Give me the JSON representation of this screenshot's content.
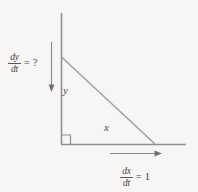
{
  "figure": {
    "kind": "related-rates-right-triangle-diagram",
    "background_color": "#f7f6f4",
    "line_color": "#8b8b90",
    "text_color": "#3f3f42",
    "labels": {
      "dy_dt": {
        "numerator": "dy",
        "denominator": "dt",
        "relation": "=",
        "value": "?"
      },
      "dx_dt": {
        "numerator": "dx",
        "denominator": "dt",
        "relation": "=",
        "value": "1"
      },
      "vertical_leg": "y",
      "horizontal_leg": "x"
    },
    "geometry": {
      "vertical_axis": {
        "x": 61,
        "y_top": 13,
        "y_bottom": 144
      },
      "horizontal_axis": {
        "y": 144,
        "x_left": 61,
        "x_right": 186
      },
      "hypotenuse": {
        "x1": 61,
        "y1": 57,
        "x2": 155,
        "y2": 144
      },
      "right_angle_marker": {
        "x": 61,
        "y": 144,
        "size": 9
      },
      "down_arrow": {
        "x": 51,
        "y_start": 42,
        "y_end": 91
      },
      "right_arrow": {
        "y": 153,
        "x_start": 110,
        "x_end": 161
      }
    }
  }
}
